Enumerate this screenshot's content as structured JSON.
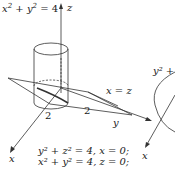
{
  "figure": {
    "cylinder_label": {
      "lhs_a": "x",
      "lhs_b": "y",
      "rhs": "= 4",
      "exp": "2",
      "plus": "+"
    },
    "axes": {
      "z": "z",
      "y": "y",
      "x": "x"
    },
    "plane_label": "x = z",
    "tick_labels": {
      "y_tick": "2",
      "x_tick": "2"
    },
    "equations": [
      "y² + z² = 4, x = 0;",
      "x² + y² = 4, z = 0;"
    ],
    "right_partial_label": "y² +",
    "right_partial_axis": "x",
    "colors": {
      "stroke": "#333333",
      "text": "#1a1a1a",
      "background": "#ffffff"
    }
  }
}
